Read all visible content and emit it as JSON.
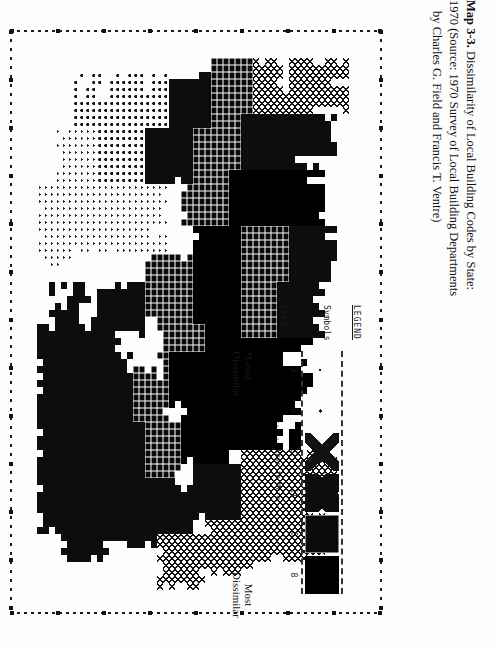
{
  "figure": {
    "legend_title": "LEGEND",
    "symbols_label": "Symbols",
    "freq_label": "Freq.",
    "frequencies": [
      "3",
      "8",
      "12",
      "11",
      "6",
      "8"
    ],
    "scale_text": "-------- Less to More -----------",
    "least_label_line1": "*Least",
    "least_label_line2": "Dissimilar",
    "most_label_line1": "Most",
    "most_label_line2": "Dissimilar",
    "classes": [
      {
        "name": "least-dissimilar",
        "symbol": ".",
        "freq": "3"
      },
      {
        "name": "low",
        "symbol": ":",
        "freq": "8"
      },
      {
        "name": "low-mid",
        "symbol": "X",
        "freq": "12"
      },
      {
        "name": "mid-high",
        "symbol": "0X",
        "freq": "11"
      },
      {
        "name": "high",
        "symbol": "#",
        "freq": "6"
      },
      {
        "name": "most-dissimilar",
        "symbol": "M",
        "freq": "8"
      }
    ]
  },
  "caption": {
    "number": "Map 3-3.",
    "line1": " Dissimilarity of Local Building Codes by State:",
    "line2": "1970 (Source: 1970 Survey of Local Building Departments",
    "line3": "by Charles G. Field and Francis T. Ventre)"
  },
  "chart_data": {
    "type": "heatmap",
    "title": "Dissimilarity of Local Building Codes by State: 1970",
    "subtitle": "Source: 1970 Survey of Local Building Departments by Charles G. Field and Francis T. Ventre",
    "xlabel": "",
    "ylabel": "",
    "grid": false,
    "legend_position": "right",
    "legend_entries": [
      {
        "label": "3",
        "class": 1,
        "meaning": "*Least Dissimilar"
      },
      {
        "label": "8",
        "class": 2,
        "meaning": ""
      },
      {
        "label": "12",
        "class": 3,
        "meaning": ""
      },
      {
        "label": "11",
        "class": 4,
        "meaning": ""
      },
      {
        "label": "6",
        "class": 5,
        "meaning": ""
      },
      {
        "label": "8",
        "class": 6,
        "meaning": "Most Dissimilar"
      }
    ],
    "annotations": [
      "-------- Less to More -----------"
    ],
    "note": "Line-printer choropleth of the contiguous United States. Six overstrike density classes ranging from sparse dots (least dissimilar) to solid black blocks (most dissimilar). Frequencies give the number of states in each class; they total 48.",
    "rows": 58,
    "cols": 80,
    "values": [
      "00000000000000000000000000000000000000000000000000000000000000000000000000000000",
      "00000000000000000000000000000000000000000000000000000000000000000000000000000000",
      "00000000000000000000000000000000000000000000000000000000000000000000000000000000",
      "00000000000000000000000000000000000000000000000000000000000000000000000000000000",
      "00000000000000000000000000000000000000000000000000000000000000000000000000000000",
      "00000000000000000000000000000000000000000000000000000000000000000000000000000000",
      "00000000000000000000000000000000000000000000000000000000000000000000000000000000",
      "00000000000000000000000000000000000000000000000000000000000000000000000000000000",
      "00000000000000000000000000000000000000000000000000000000000000000000000000000000",
      "00000000000000000000000000000000000000000000000000000000000000000000000000000000",
      "00000000000000000000000000000000000000000000000000000000000000000000000000000000",
      "00000000000000000000000000000000000000000000000000000000000000000000000000000000",
      "00000000000000000000000000000000000000000000000000000000000000000000000000000000",
      "00000000000000000000000000000000000000000000000000000000000000000000000000000000",
      "00000000000000000000000000000000000000000000000000000000000000000000000000000000",
      "00000000003333000000000000000000000000000000000000000000000000000000000000000000",
      "00000000003333000000000000000000000000000000000000000000000000000000000000000000",
      "00000000003333300000000000000000000000000000000000000000000000000000000000000000",
      "00000000003333300000000000000000000000000000000000000000000000000000000000000000",
      "00000000000033300000000000000000000000000000000000000000000000000000000000000000",
      "00000000000033300000000000000000000000000000000000000000000000000000000000000000",
      "00000000000033333300000000000000000000000000000000000000000000000000000000000000",
      "00000000000033333333000000000000000000000000000000000000000000000000000000000000",
      "00000000000033333333333000000000000000000000000000000000000000000000000000000000",
      "00000000000000033333333366666000000000000000000000000000000000000000000000000000",
      "00000000000000000033336666666660000000000000000000000000000000000000000000000000",
      "00000000000000000000006666666666660000000000000000000000000000000000000000000000",
      "00000000000000000000006666666666666000000000000000000000000000000000000000000000",
      "00000000000000000000666666666666666600000000000000000000000000000000000000000000",
      "00000000000000000000666666666666666666000000000000000000000000000000000000000000",
      "00000000000000000000066666666666666666660000000000000000000000000000000000000000",
      "00000000000000000000006666666666666666666600000000000000000000000000000000000000",
      "00000000000000000000000066666666666666666666000000000000000000000000000000000000",
      "00000000000000000000000000666666666666666666660000000000000000000000000000000000",
      "00000000000000000000000000006666666666666666666600000000000000000000000000000000",
      "00000000000000000000000000000066666666666666666666000000000000000000000000000000",
      "00000000000000000000000000000000666666666666666666660000000000000000000000000000",
      "00000000000000000000000000000000006666666666666666666600000000000000000000000000",
      "00000000000000000000000000000000000066666666666666666666000000000000000000000000",
      "00000000000000000000000000000000000000666666666666666666660000000000000000000000",
      "00000000000000000000000000000000000000006666666666666666666600000000000000000000",
      "00000000000000000000000000000000000000000066666666666666666666000000000000000000",
      "00000000000000000000000000000000000000000000666666666666666666660000000000000000",
      "00000000000000000000000000000000000000000000006666666666666666666600000000000000",
      "00000000000000000000000000000000000000000000000066666666666666666666000000000000",
      "00000000000000000000000000000000000000000000000000666666666666666666660000000000",
      "00000000000000000000000000000000000000000000000000006666666666666666666600000000",
      "00000000000000000000000000000000000000000000000000000066666666666666666666000000",
      "00000000000000000000000000000000000000000000000000000000666666666666666666660000",
      "00000000000000000000000000000000000000000000000000000000006666666666666666666600",
      "00000000000000000000000000000000000000000000000000000000000066666666666666666666",
      "00000000000000000000000000000000000000000000000000000000000000000000000000000000",
      "00000000000000000000000000000000000000000000000000000000000000000000000000000000",
      "00000000000000000000000000000000000000000000000000000000000000000000000000000000",
      "00000000000000000000000000000000000000000000000000000000000000000000000000000000",
      "00000000000000000000000000000000000000000000000000000000000000000000000000000000",
      "00000000000000000000000000000000000000000000000000000000000000000000000000000000",
      "00000000000000000000000000000000000000000000000000000000000000000000000000000000"
    ]
  }
}
